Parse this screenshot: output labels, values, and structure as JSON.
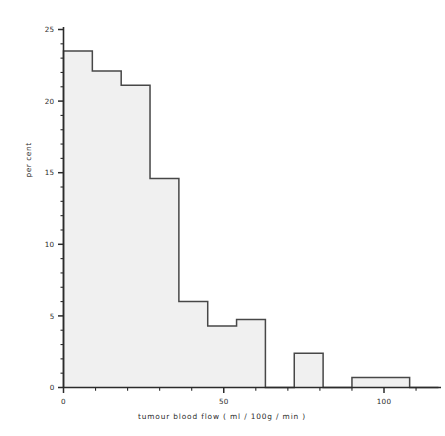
{
  "chart_data": {
    "type": "bar",
    "title": "",
    "subtitle": "",
    "xlabel": "tumour blood flow ( ml / 100g / min )",
    "ylabel": "per cent",
    "xlim": [
      0,
      118
    ],
    "ylim": [
      0,
      25.9
    ],
    "grid": false,
    "legend": false,
    "legend_position": "none",
    "xtick_labels": [
      "0",
      "50",
      "100"
    ],
    "xtick_values": [
      0,
      50,
      100
    ],
    "xtick_minor_step": 10,
    "ytick_labels": [
      "0",
      "5",
      "10",
      "15",
      "20",
      "25"
    ],
    "ytick_values": [
      0,
      5,
      10,
      15,
      20,
      25
    ],
    "ytick_minor_step": 1,
    "bin_edges": [
      0,
      9,
      18,
      27,
      36,
      45,
      54,
      63,
      72,
      81,
      90,
      99,
      108,
      117
    ],
    "categories": [
      "0-9",
      "9-18",
      "18-27",
      "27-36",
      "36-45",
      "45-54",
      "54-63",
      "63-72",
      "72-81",
      "81-90",
      "90-99",
      "99-108",
      "108-117"
    ],
    "values": [
      23.5,
      22.1,
      21.1,
      14.6,
      6.0,
      4.3,
      4.75,
      0,
      2.4,
      0,
      0.7,
      0.7,
      0
    ],
    "series": [
      {
        "name": "tumour blood flow distribution",
        "values": [
          23.5,
          22.1,
          21.1,
          14.6,
          6.0,
          4.3,
          4.75,
          0,
          2.4,
          0,
          0.7,
          0.7,
          0
        ]
      }
    ],
    "bar_fill_color": "#f0f0f0",
    "bar_edge_color": "#474747",
    "axis_color": "#2b2b2b",
    "annotations": []
  }
}
